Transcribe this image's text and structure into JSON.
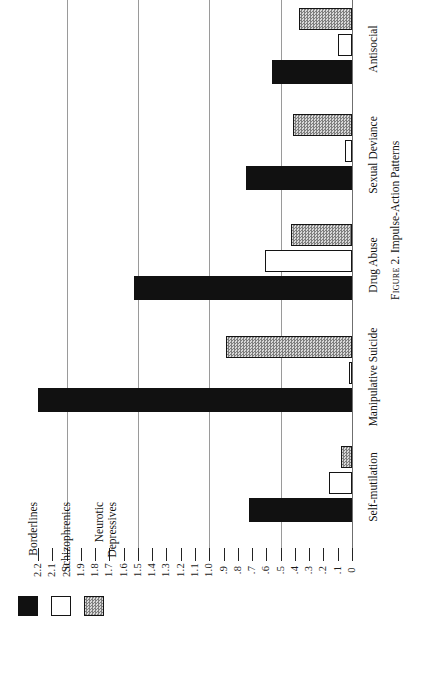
{
  "caption": {
    "figure_word": "Figure",
    "number": "2.",
    "title": "Impulse-Action Patterns",
    "full": "Figure 2. Impulse-Action Patterns"
  },
  "legend": {
    "position": "bottom-left",
    "entries": [
      {
        "label": "Borderlines",
        "swatch": "black",
        "color": "#111111"
      },
      {
        "label": "Schizophrenics",
        "swatch": "white",
        "color": "#ffffff"
      },
      {
        "label": "Neurotic\nDepressives",
        "swatch": "gray",
        "color": "#b4b4b4"
      }
    ]
  },
  "axis": {
    "orientation": "horizontal-reversed",
    "max": 2.2,
    "min": 0,
    "tick_step": 0.1,
    "gridline_values": [
      2.0,
      1.5,
      1.0,
      0.5
    ],
    "tick_labels": [
      "2.2",
      "2.1",
      "2.0",
      "1.9",
      "1.8",
      "1.7",
      "1.6",
      "1.5",
      "1.4",
      "1.3",
      "1.2",
      "1.1",
      "1.0",
      ".9",
      ".8",
      ".7",
      ".6",
      ".5",
      ".4",
      ".3",
      ".2",
      ".1",
      "0"
    ]
  },
  "chart_data": {
    "type": "bar",
    "title": "Impulse-Action Patterns",
    "orientation": "horizontal",
    "xlabel": "",
    "ylabel": "",
    "xlim": [
      0,
      2.2
    ],
    "grid": true,
    "legend_position": "bottom-left",
    "categories": [
      "Self-mutilation",
      "Manipulative Suicide",
      "Drug Abuse",
      "Sexual Deviance",
      "Antisocial"
    ],
    "series": [
      {
        "name": "Borderlines",
        "fill": "black",
        "color": "#111111",
        "values": [
          0.72,
          2.2,
          1.53,
          0.74,
          0.56
        ]
      },
      {
        "name": "Schizophrenics",
        "fill": "white",
        "color": "#ffffff",
        "values": [
          0.16,
          0.02,
          0.61,
          0.05,
          0.1
        ]
      },
      {
        "name": "Neurotic Depressives",
        "fill": "gray",
        "color": "#b4b4b4",
        "values": [
          0.08,
          0.88,
          0.43,
          0.41,
          0.37
        ]
      }
    ]
  }
}
